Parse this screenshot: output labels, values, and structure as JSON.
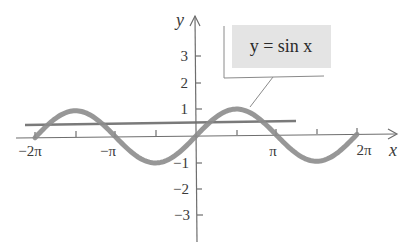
{
  "chart_data": {
    "type": "line",
    "title": "",
    "xlabel": "x",
    "ylabel": "y",
    "xlim": [
      -6.8,
      7.2
    ],
    "ylim": [
      -4.0,
      4.5
    ],
    "x_ticks": [
      {
        "value": -6.2832,
        "label": "−2π"
      },
      {
        "value": -4.7124,
        "label": ""
      },
      {
        "value": -3.1416,
        "label": "−π"
      },
      {
        "value": -1.5708,
        "label": ""
      },
      {
        "value": 1.5708,
        "label": ""
      },
      {
        "value": 3.1416,
        "label": "π"
      },
      {
        "value": 4.7124,
        "label": ""
      },
      {
        "value": 6.2832,
        "label": "2π"
      }
    ],
    "y_ticks": [
      {
        "value": 3,
        "label": "3"
      },
      {
        "value": 2,
        "label": "2"
      },
      {
        "value": 1,
        "label": "1"
      },
      {
        "value": -1,
        "label": "−1"
      },
      {
        "value": -2,
        "label": "−2"
      },
      {
        "value": -3,
        "label": "−3"
      }
    ],
    "grid": false,
    "series": [
      {
        "name": "y = sin x",
        "function": "sin(x)",
        "x_range": [
          -6.2832,
          6.2832
        ],
        "color": "#8c8c8c",
        "line_width": 5,
        "points": [
          [
            -6.2832,
            0
          ],
          [
            -5.4978,
            0.7071
          ],
          [
            -4.7124,
            1
          ],
          [
            -3.927,
            0.7071
          ],
          [
            -3.1416,
            0
          ],
          [
            -2.3562,
            -0.7071
          ],
          [
            -1.5708,
            -1
          ],
          [
            -0.7854,
            -0.7071
          ],
          [
            0,
            0
          ],
          [
            0.7854,
            0.7071
          ],
          [
            1.5708,
            1
          ],
          [
            2.3562,
            0.7071
          ],
          [
            3.1416,
            0
          ],
          [
            3.927,
            -0.7071
          ],
          [
            4.7124,
            -1
          ],
          [
            5.4978,
            -0.7071
          ],
          [
            6.2832,
            0
          ]
        ]
      },
      {
        "name": "horizontal line",
        "function": "y = 0.4",
        "x_range": [
          -6.6,
          3.8
        ],
        "y_value": 0.4,
        "color": "#7a7a7a",
        "line_width": 2.5
      }
    ],
    "annotations": [
      {
        "text": "y = sin x",
        "points_to": [
          1.9,
          0.95
        ],
        "box_fill": "#e4e4e4"
      }
    ],
    "legend": "none"
  },
  "labels": {
    "x_axis": "x",
    "y_axis": "y",
    "callout": "y = sin x",
    "x_tick_neg2pi": "−2π",
    "x_tick_negpi": "−π",
    "x_tick_pi": "π",
    "x_tick_2pi": "2π",
    "y_tick_3": "3",
    "y_tick_2": "2",
    "y_tick_1": "1",
    "y_tick_neg1": "−1",
    "y_tick_neg2": "−2",
    "y_tick_neg3": "−3"
  },
  "colors": {
    "axis": "#6e6e6e",
    "curve": "#8c8c8c",
    "hline": "#7a7a7a",
    "callout_fill": "#e4e4e4",
    "text": "#3a3a3a"
  }
}
